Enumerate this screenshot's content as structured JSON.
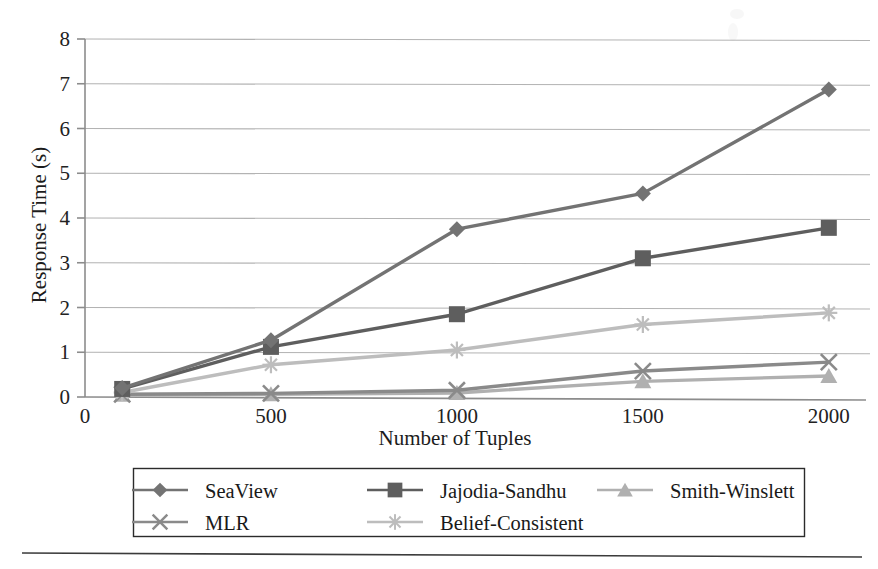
{
  "chart_data": {
    "type": "line",
    "title": "",
    "subtitle": "",
    "xlabel": "Number of Tuples",
    "ylabel": "Response Time (s)",
    "x": [
      100,
      500,
      1000,
      1500,
      2000
    ],
    "xticks": [
      "0",
      "500",
      "1000",
      "1500",
      "2000"
    ],
    "xtick_values": [
      0,
      500,
      1000,
      1500,
      2000
    ],
    "yticks": [
      "0",
      "1",
      "2",
      "3",
      "4",
      "5",
      "6",
      "7",
      "8"
    ],
    "ytick_values": [
      0,
      1,
      2,
      3,
      4,
      5,
      6,
      7,
      8
    ],
    "xlim": [
      0,
      2100
    ],
    "ylim": [
      0,
      8
    ],
    "grid": "horizontal",
    "legend_position": "bottom",
    "series": [
      {
        "name": "SeaView",
        "marker": "diamond",
        "color": "#737373",
        "values": [
          0.2,
          1.27,
          3.75,
          4.55,
          6.87
        ]
      },
      {
        "name": "Jajodia-Sandhu",
        "marker": "square",
        "color": "#5e5e5e",
        "values": [
          0.18,
          1.12,
          1.85,
          3.1,
          3.78
        ]
      },
      {
        "name": "Smith-Winslett",
        "marker": "triangle",
        "color": "#b0b0b0",
        "values": [
          0.05,
          0.06,
          0.09,
          0.35,
          0.47
        ]
      },
      {
        "name": "MLR",
        "marker": "cross",
        "color": "#8a8a8a",
        "values": [
          0.06,
          0.08,
          0.15,
          0.58,
          0.78
        ]
      },
      {
        "name": "Belief-Consistent",
        "marker": "asterisk",
        "color": "#bdbdbd",
        "values": [
          0.1,
          0.72,
          1.05,
          1.62,
          1.88
        ]
      }
    ]
  },
  "figure": {
    "background_color": "#ffffff",
    "axis_color": "#8c8c8c",
    "grid_color": "#b3b3b3",
    "legend_border_color": "#2b2b2b",
    "footer_rule": true
  },
  "legend": {
    "items": [
      {
        "label": "SeaView",
        "marker": "diamond-marker-icon"
      },
      {
        "label": "Jajodia-Sandhu",
        "marker": "square-marker-icon"
      },
      {
        "label": "Smith-Winslett",
        "marker": "triangle-marker-icon"
      },
      {
        "label": "MLR",
        "marker": "cross-marker-icon"
      },
      {
        "label": "Belief-Consistent",
        "marker": "asterisk-marker-icon"
      }
    ]
  }
}
